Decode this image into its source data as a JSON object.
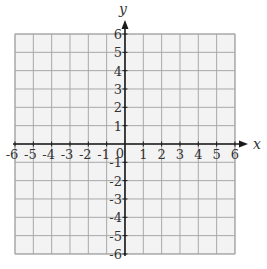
{
  "chart_data": {
    "type": "scatter",
    "title": "",
    "xlabel": "x",
    "ylabel": "y",
    "xlim": [
      -6,
      6
    ],
    "ylim": [
      -6,
      6
    ],
    "grid": true,
    "x_ticks": [
      -6,
      -5,
      -4,
      -3,
      -2,
      -1,
      1,
      2,
      3,
      4,
      5,
      6
    ],
    "y_ticks": [
      -6,
      -5,
      -4,
      -3,
      -2,
      -1,
      1,
      2,
      3,
      4,
      5,
      6
    ],
    "origin_label": "0",
    "series": []
  },
  "style": {
    "grid_background": "#f3f3f3",
    "grid_line_color": "#a8a8a8",
    "axis_color": "#1a1a1a"
  },
  "layout": {
    "grid_left": 15,
    "grid_top": 34,
    "unit": 18.33,
    "x_axis_end": 248,
    "y_axis_top": 20
  }
}
